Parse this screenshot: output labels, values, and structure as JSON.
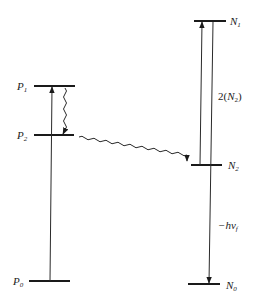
{
  "diagram": {
    "type": "energy-level-diagram",
    "left_system": {
      "levels": [
        {
          "id": "P1",
          "label": "P",
          "subscript": "1"
        },
        {
          "id": "P2",
          "label": "P",
          "subscript": "2"
        },
        {
          "id": "P0",
          "label": "P",
          "subscript": "0"
        }
      ]
    },
    "right_system": {
      "levels": [
        {
          "id": "N1",
          "label": "N",
          "subscript": "1"
        },
        {
          "id": "N2",
          "label": "N",
          "subscript": "2"
        },
        {
          "id": "N0",
          "label": "N",
          "subscript": "0"
        }
      ]
    },
    "annotations": {
      "pump_label_pre": "2(",
      "pump_label_N": "N",
      "pump_label_sub": "2",
      "pump_label_post": ")",
      "emission_label_pre": "−hν",
      "emission_label_sub": "f"
    },
    "transitions": [
      {
        "from": "P0",
        "to": "P1",
        "style": "straight-arrow-up"
      },
      {
        "from": "P1",
        "to": "P2",
        "style": "wavy-arrow-down"
      },
      {
        "from": "P2",
        "to": "N2",
        "style": "wavy-arrow-energy-transfer"
      },
      {
        "from": "N2",
        "to": "N1",
        "style": "straight-arrow-up"
      },
      {
        "from": "N1",
        "to": "N0",
        "style": "straight-arrow-down"
      }
    ]
  }
}
